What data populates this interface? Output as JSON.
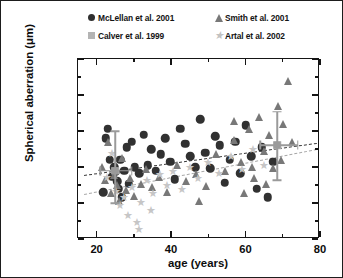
{
  "chart_data": {
    "type": "scatter",
    "title": "",
    "xlabel": "age (years)",
    "ylabel": "Spherical aberration (μm)",
    "xlim": [
      15,
      80
    ],
    "ylim": [
      -0.3,
      1.0
    ],
    "xticks": [
      20,
      40,
      60,
      80
    ],
    "xtick_labels": [
      "20",
      "40",
      "60",
      "80"
    ],
    "yticks": [
      1.0,
      0.8,
      0.5,
      0.3,
      0.0,
      -0.3
    ],
    "ytick_labels": [
      "1.0",
      "0.8",
      "0.5",
      "0.3",
      "0.0",
      "-0.3"
    ],
    "grid": false,
    "legend_position": "above-plot",
    "series": [
      {
        "name": "McLellan et al. 2001",
        "marker": "circle",
        "color": "#313131",
        "points": [
          [
            22.5,
            0.46
          ],
          [
            23.5,
            0.34
          ],
          [
            24.2,
            0.22
          ],
          [
            24.8,
            0.3
          ],
          [
            25.2,
            0.26
          ],
          [
            25.6,
            0.18
          ],
          [
            25.9,
            0.12
          ],
          [
            26.3,
            0.34
          ],
          [
            26.8,
            0.05
          ],
          [
            27.4,
            0.27
          ],
          [
            28.1,
            0.41
          ],
          [
            28.6,
            0.16
          ],
          [
            29.5,
            0.44
          ],
          [
            30.2,
            0.3
          ],
          [
            31.4,
            0.25
          ],
          [
            32.6,
            0.48
          ],
          [
            33.8,
            0.31
          ],
          [
            34.7,
            0.4
          ],
          [
            35.9,
            0.27
          ],
          [
            37.2,
            0.37
          ],
          [
            38.5,
            0.46
          ],
          [
            39.8,
            0.33
          ],
          [
            41.0,
            0.2
          ],
          [
            42.4,
            0.52
          ],
          [
            43.8,
            0.43
          ],
          [
            45.1,
            0.36
          ],
          [
            46.5,
            0.3
          ],
          [
            47.9,
            0.6
          ],
          [
            49.2,
            0.38
          ],
          [
            50.5,
            0.29
          ],
          [
            51.8,
            0.47
          ],
          [
            53.1,
            0.42
          ],
          [
            54.4,
            0.17
          ],
          [
            55.8,
            0.34
          ],
          [
            57.2,
            0.44
          ],
          [
            58.6,
            0.25
          ],
          [
            60.1,
            0.55
          ],
          [
            61.5,
            0.36
          ],
          [
            63.0,
            0.12
          ],
          [
            64.4,
            0.41
          ],
          [
            66.0,
            0.05
          ],
          [
            67.5,
            0.33
          ],
          [
            21.8,
            0.09
          ],
          [
            23.0,
            0.52
          ]
        ]
      },
      {
        "name": "Calver et al. 1999",
        "marker": "square",
        "color": "#aeaeae",
        "points": [
          [
            25.0,
            0.27
          ],
          [
            68.5,
            0.42
          ]
        ]
      },
      {
        "name": "Smith et al. 2001",
        "marker": "triangle",
        "color": "#787878",
        "points": [
          [
            21.5,
            0.3
          ],
          [
            22.3,
            0.19
          ],
          [
            23.1,
            0.44
          ],
          [
            23.9,
            0.08
          ],
          [
            24.6,
            0.23
          ],
          [
            25.4,
            0.15
          ],
          [
            26.1,
            0.02
          ],
          [
            26.9,
            0.35
          ],
          [
            27.8,
            0.11
          ],
          [
            28.9,
            0.21
          ],
          [
            30.0,
            0.06
          ],
          [
            31.8,
            0.16
          ],
          [
            33.2,
            0.28
          ],
          [
            35.0,
            0.13
          ],
          [
            36.8,
            0.22
          ],
          [
            39.0,
            0.09
          ],
          [
            41.6,
            0.31
          ],
          [
            44.0,
            0.18
          ],
          [
            46.8,
            0.24
          ],
          [
            49.5,
            0.14
          ],
          [
            52.0,
            0.37
          ],
          [
            54.5,
            0.27
          ],
          [
            56.8,
            0.45
          ],
          [
            58.9,
            0.33
          ],
          [
            60.8,
            0.52
          ],
          [
            62.2,
            0.21
          ],
          [
            63.6,
            0.62
          ],
          [
            64.9,
            0.39
          ],
          [
            66.2,
            0.48
          ],
          [
            67.4,
            0.29
          ],
          [
            68.8,
            0.71
          ],
          [
            70.1,
            0.56
          ],
          [
            71.3,
            0.88
          ],
          [
            72.4,
            0.44
          ],
          [
            69.5,
            0.34
          ],
          [
            65.5,
            0.16
          ],
          [
            59.5,
            0.08
          ],
          [
            47.5,
            0.02
          ],
          [
            57.0,
            0.58
          ],
          [
            61.8,
            0.3
          ]
        ]
      },
      {
        "name": "Artal et al. 2002",
        "marker": "star",
        "color": "#c6c6c6",
        "points": [
          [
            24.0,
            0.38
          ],
          [
            25.1,
            0.1
          ],
          [
            26.2,
            -0.02
          ],
          [
            27.3,
            0.05
          ],
          [
            28.4,
            -0.1
          ],
          [
            29.6,
            0.13
          ],
          [
            30.8,
            -0.16
          ],
          [
            32.0,
            0.01
          ],
          [
            33.5,
            0.19
          ],
          [
            35.2,
            0.08
          ],
          [
            37.0,
            0.24
          ],
          [
            38.8,
            0.15
          ],
          [
            40.5,
            0.27
          ],
          [
            42.8,
            0.12
          ],
          [
            45.0,
            0.3
          ],
          [
            47.2,
            0.21
          ],
          [
            50.0,
            0.33
          ],
          [
            53.0,
            0.25
          ],
          [
            56.0,
            0.36
          ],
          [
            59.0,
            0.28
          ],
          [
            62.0,
            0.4
          ],
          [
            65.0,
            0.31
          ],
          [
            22.8,
            0.22
          ],
          [
            31.5,
            -0.22
          ],
          [
            34.5,
            -0.06
          ]
        ]
      }
    ],
    "trend_lines": [
      {
        "name": "upper-regression",
        "color": "#3a3a3a",
        "x0": 16.5,
        "y0": 0.235,
        "x1": 79.0,
        "y1": 0.435
      },
      {
        "name": "lower-regression",
        "color": "#a8a8a8",
        "x0": 16.5,
        "y0": 0.075,
        "x1": 79.0,
        "y1": 0.4
      }
    ],
    "error_bars": [
      {
        "name": "calver-young-errorbar",
        "x": 25.0,
        "y": 0.27,
        "y_low": 0.0,
        "y_high": 0.5,
        "x_low": 21.0,
        "x_high": 29.5,
        "color": "#9a9a9a"
      },
      {
        "name": "calver-old-errorbar",
        "x": 68.5,
        "y": 0.42,
        "y_low": 0.19,
        "y_high": 0.66,
        "x_low": 64.0,
        "x_high": 74.0,
        "color": "#9a9a9a"
      }
    ]
  },
  "legend": {
    "entries": [
      {
        "label": "McLellan et al. 2001",
        "marker": "circle"
      },
      {
        "label": "Calver et al. 1999",
        "marker": "square"
      },
      {
        "label": "Smith et al. 2001",
        "marker": "triangle"
      },
      {
        "label": "Artal et al. 2002",
        "marker": "star"
      }
    ]
  }
}
